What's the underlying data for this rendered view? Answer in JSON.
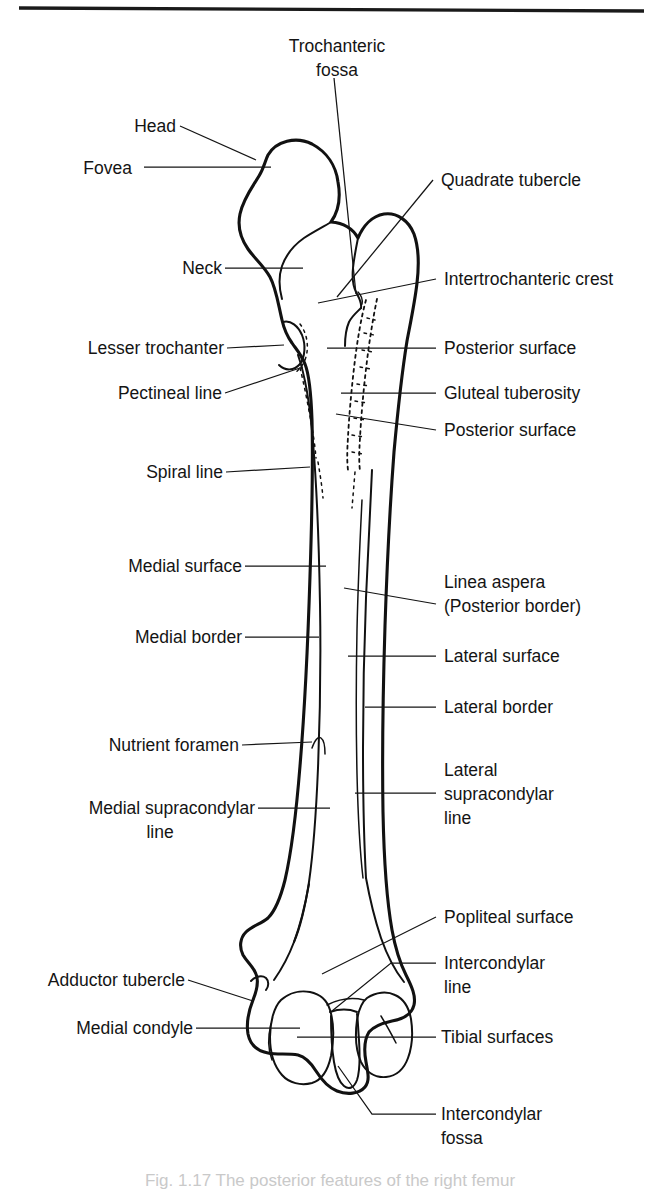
{
  "figure": {
    "caption": "Fig. 1.17   The posterior features of the right femur",
    "colors": {
      "ink": "#111111",
      "leader": "#141414",
      "background": "#ffffff",
      "rule": "#1a1a1a"
    }
  },
  "labels": {
    "trochanteric_fossa_1": "Trochanteric",
    "trochanteric_fossa_2": "fossa",
    "head": "Head",
    "fovea": "Fovea",
    "quadrate_tubercle": "Quadrate tubercle",
    "neck": "Neck",
    "intertrochanteric_crest": "Intertrochanteric crest",
    "lesser_trochanter": "Lesser trochanter",
    "posterior_surface_upper": "Posterior surface",
    "pectineal_line": "Pectineal line",
    "gluteal_tuberosity": "Gluteal tuberosity",
    "posterior_surface_lower": "Posterior surface",
    "spiral_line": "Spiral line",
    "medial_surface": "Medial surface",
    "linea_aspera_1": "Linea aspera",
    "linea_aspera_2": "(Posterior border)",
    "medial_border": "Medial border",
    "lateral_surface": "Lateral surface",
    "lateral_border": "Lateral border",
    "nutrient_foramen": "Nutrient foramen",
    "lateral_supracondylar_1": "Lateral",
    "lateral_supracondylar_2": "supracondylar",
    "lateral_supracondylar_3": "line",
    "medial_supracondylar_1": "Medial supracondylar",
    "medial_supracondylar_2": "line",
    "popliteal_surface": "Popliteal surface",
    "adductor_tubercle": "Adductor tubercle",
    "intercondylar_line_1": "Intercondylar",
    "intercondylar_line_2": "line",
    "medial_condyle": "Medial condyle",
    "tibial_surfaces": "Tibial surfaces",
    "intercondylar_fossa_1": "Intercondylar",
    "intercondylar_fossa_2": "fossa"
  }
}
